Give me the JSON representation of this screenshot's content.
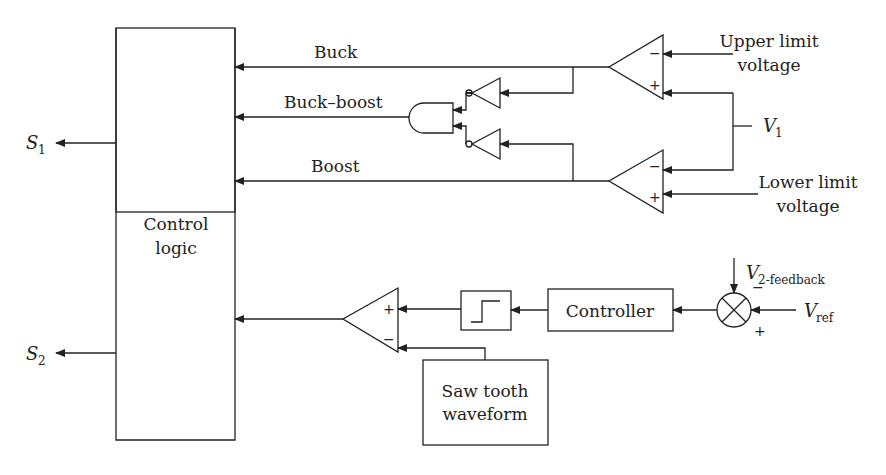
{
  "blocks": {
    "control_logic": {
      "line1": "Control",
      "line2": "logic"
    },
    "controller": "Controller",
    "sawtooth": {
      "line1": "Saw tooth",
      "line2": "waveform"
    },
    "comparator_step": "step"
  },
  "signals": {
    "buck": "Buck",
    "buck_boost": "Buck–boost",
    "boost": "Boost",
    "upper": {
      "line1": "Upper limit",
      "line2": "voltage"
    },
    "lower": {
      "line1": "Lower limit",
      "line2": "voltage"
    },
    "v1": {
      "main": "V",
      "sub": "1"
    },
    "v2fb": {
      "main": "V",
      "sub": "2-feedback"
    },
    "vref": {
      "main": "V",
      "sub": "ref"
    },
    "s1": {
      "main": "S",
      "sub": "1"
    },
    "s2": {
      "main": "S",
      "sub": "2"
    }
  },
  "signs": {
    "minus": "−",
    "plus": "+"
  }
}
